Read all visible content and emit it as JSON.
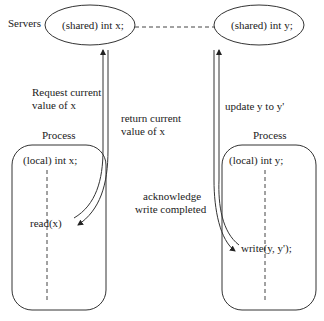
{
  "labels": {
    "servers": "Servers",
    "shared_x": "(shared) int x;",
    "shared_y": "(shared) int y;",
    "process_left": "Process",
    "process_right": "Process",
    "local_x": "(local) int x;",
    "local_y": "(local) int y;",
    "read": "read(x)",
    "write": "write(y, y');",
    "request_line1": "Request current",
    "request_line2": "value of x",
    "return_line1": "return current",
    "return_line2": "value of x",
    "update": "update y to y'",
    "ack_line1": "acknowledge",
    "ack_line2": "write completed"
  }
}
